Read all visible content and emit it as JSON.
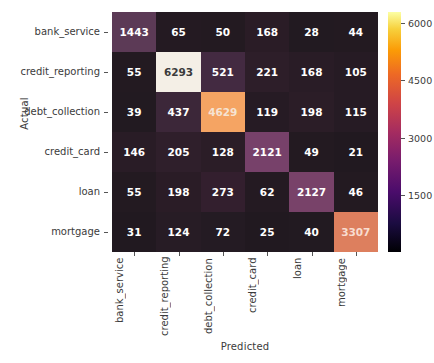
{
  "chart_data": {
    "type": "heatmap",
    "title": "",
    "xlabel": "Predicted",
    "ylabel": "Actual",
    "categories": [
      "bank_service",
      "credit_reporting",
      "debt_collection",
      "credit_card",
      "loan",
      "mortgage"
    ],
    "x_tick_labels": [
      "bank_service",
      "credit_reporting",
      "debt_collection",
      "credit_card",
      "loan",
      "mortgage"
    ],
    "y_tick_labels": [
      "bank_service",
      "credit_reporting",
      "debt_collection",
      "credit_card",
      "loan",
      "mortgage"
    ],
    "rows": [
      {
        "label": "bank_service",
        "values": [
          1443,
          65,
          50,
          168,
          28,
          44
        ]
      },
      {
        "label": "credit_reporting",
        "values": [
          55,
          6293,
          521,
          221,
          168,
          105
        ]
      },
      {
        "label": "debt_collection",
        "values": [
          39,
          437,
          4629,
          119,
          198,
          115
        ]
      },
      {
        "label": "credit_card",
        "values": [
          146,
          205,
          128,
          2121,
          49,
          21
        ]
      },
      {
        "label": "loan",
        "values": [
          55,
          198,
          273,
          62,
          2127,
          46
        ]
      },
      {
        "label": "mortgage",
        "values": [
          31,
          124,
          72,
          25,
          40,
          3307
        ]
      }
    ],
    "colormap": "magma",
    "colorbar": {
      "ticks": [
        1500,
        3000,
        4500,
        6000
      ],
      "tick_labels": [
        "1500",
        "3000",
        "4500",
        "6000"
      ],
      "vmin": 0,
      "vmax": 6293,
      "position": "right"
    },
    "grid": false,
    "annotations": true,
    "cell_colors": [
      [
        "#5c3a56",
        "#241a22",
        "#231a21",
        "#2a1c26",
        "#221a21",
        "#231a21"
      ],
      [
        "#231a21",
        "#f4efe6",
        "#432a41",
        "#2d1e29",
        "#291c26",
        "#261b24"
      ],
      [
        "#221a21",
        "#3c2739",
        "#f5a463",
        "#261b24",
        "#2b1d27",
        "#261b24"
      ],
      [
        "#291c26",
        "#2f1f2b",
        "#2b1d27",
        "#77416a",
        "#231a21",
        "#211920"
      ],
      [
        "#231a21",
        "#2a1c26",
        "#331f2e",
        "#241a22",
        "#784269",
        "#231a21"
      ],
      [
        "#211920",
        "#271c25",
        "#241b23",
        "#211920",
        "#221a21",
        "#dd7f5e"
      ]
    ],
    "cell_text_colors": [
      [
        "#ffffff",
        "#ffffff",
        "#ffffff",
        "#ffffff",
        "#ffffff",
        "#ffffff"
      ],
      [
        "#ffffff",
        "#3b3b3b",
        "#ffffff",
        "#ffffff",
        "#ffffff",
        "#ffffff"
      ],
      [
        "#ffffff",
        "#ffffff",
        "#f6e3d2",
        "#ffffff",
        "#ffffff",
        "#ffffff"
      ],
      [
        "#ffffff",
        "#ffffff",
        "#ffffff",
        "#ffffff",
        "#ffffff",
        "#ffffff"
      ],
      [
        "#ffffff",
        "#ffffff",
        "#ffffff",
        "#ffffff",
        "#ffffff",
        "#ffffff"
      ],
      [
        "#ffffff",
        "#ffffff",
        "#ffffff",
        "#ffffff",
        "#ffffff",
        "#f8ddd0"
      ]
    ]
  },
  "figure": {
    "background": "#ffffff",
    "axis_label_color": "#3b3b3b"
  }
}
